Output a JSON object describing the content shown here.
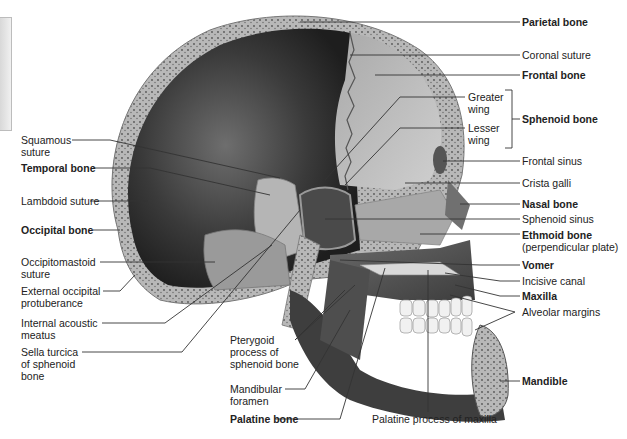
{
  "figure": {
    "type": "anatomical-illustration",
    "colors": {
      "background": "#ffffff",
      "cranial_cavity_dark": "#2b2b2b",
      "bone_mid": "#8a8a8a",
      "bone_light": "#c9c9c9",
      "diploe": "#9e9e9e",
      "teeth": "#f2f2f2",
      "leader_line": "#333333",
      "label_text": "#222222"
    }
  },
  "labels_left": [
    {
      "id": "squamous-suture",
      "lines": [
        "Squamous",
        "suture"
      ],
      "bold": false
    },
    {
      "id": "temporal-bone",
      "lines": [
        "Temporal bone"
      ],
      "bold": true
    },
    {
      "id": "lambdoid-suture",
      "lines": [
        "Lambdoid suture"
      ],
      "bold": false
    },
    {
      "id": "occipital-bone",
      "lines": [
        "Occipital bone"
      ],
      "bold": true
    },
    {
      "id": "occipitomastoid-suture",
      "lines": [
        "Occipitomastoid",
        "suture"
      ],
      "bold": false
    },
    {
      "id": "external-occipital-protuberance",
      "lines": [
        "External occipital",
        "protuberance"
      ],
      "bold": false
    },
    {
      "id": "internal-acoustic-meatus",
      "lines": [
        "Internal acoustic",
        "meatus"
      ],
      "bold": false
    },
    {
      "id": "sella-turcica",
      "lines": [
        "Sella turcica",
        "of sphenoid",
        "bone"
      ],
      "bold": false
    }
  ],
  "labels_bottom": [
    {
      "id": "pterygoid-process",
      "lines": [
        "Pterygoid",
        "process of",
        "sphenoid bone"
      ],
      "bold": false
    },
    {
      "id": "mandibular-foramen",
      "lines": [
        "Mandibular",
        "foramen"
      ],
      "bold": false
    },
    {
      "id": "palatine-bone",
      "lines": [
        "Palatine bone"
      ],
      "bold": true
    },
    {
      "id": "palatine-process-of-maxilla",
      "lines": [
        "Palatine process of maxilla"
      ],
      "bold": false
    }
  ],
  "labels_right": [
    {
      "id": "parietal-bone",
      "lines": [
        "Parietal bone"
      ],
      "bold": true
    },
    {
      "id": "coronal-suture",
      "lines": [
        "Coronal suture"
      ],
      "bold": false
    },
    {
      "id": "frontal-bone",
      "lines": [
        "Frontal bone"
      ],
      "bold": true
    },
    {
      "id": "greater-wing",
      "lines": [
        "Greater",
        "wing"
      ],
      "bold": false
    },
    {
      "id": "lesser-wing",
      "lines": [
        "Lesser",
        "wing"
      ],
      "bold": false
    },
    {
      "id": "sphenoid-bone",
      "lines": [
        "Sphenoid bone"
      ],
      "bold": true
    },
    {
      "id": "frontal-sinus",
      "lines": [
        "Frontal sinus"
      ],
      "bold": false
    },
    {
      "id": "crista-galli",
      "lines": [
        "Crista galli"
      ],
      "bold": false
    },
    {
      "id": "nasal-bone",
      "lines": [
        "Nasal bone"
      ],
      "bold": true
    },
    {
      "id": "sphenoid-sinus",
      "lines": [
        "Sphenoid sinus"
      ],
      "bold": false
    },
    {
      "id": "ethmoid-bone",
      "lines": [
        "Ethmoid bone",
        "(perpendicular plate)"
      ],
      "bold": true,
      "sub_bold": false
    },
    {
      "id": "vomer",
      "lines": [
        "Vomer"
      ],
      "bold": true
    },
    {
      "id": "incisive-canal",
      "lines": [
        "Incisive canal"
      ],
      "bold": false
    },
    {
      "id": "maxilla",
      "lines": [
        "Maxilla"
      ],
      "bold": true
    },
    {
      "id": "alveolar-margins",
      "lines": [
        "Alveolar margins"
      ],
      "bold": false
    },
    {
      "id": "mandible",
      "lines": [
        "Mandible"
      ],
      "bold": true
    }
  ]
}
